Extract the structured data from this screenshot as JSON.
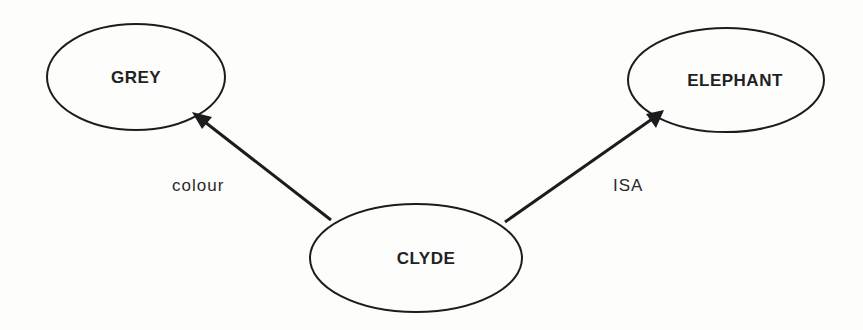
{
  "diagram": {
    "type": "semantic-network",
    "nodes": [
      {
        "id": "grey",
        "label": "GREY"
      },
      {
        "id": "elephant",
        "label": "ELEPHANT"
      },
      {
        "id": "clyde",
        "label": "CLYDE"
      }
    ],
    "edges": [
      {
        "from": "clyde",
        "to": "grey",
        "label": "colour"
      },
      {
        "from": "clyde",
        "to": "elephant",
        "label": "ISA"
      }
    ],
    "colors": {
      "stroke": "#1c1c1c",
      "text": "#222222",
      "background": "#fdfdfc"
    }
  }
}
